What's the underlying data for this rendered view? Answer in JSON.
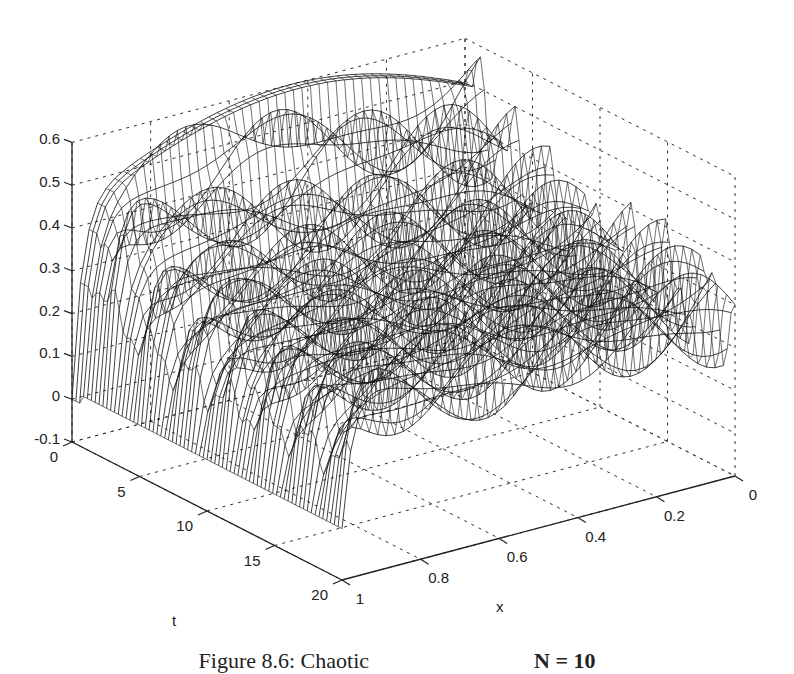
{
  "chart_data": {
    "type": "surface-mesh-3d",
    "title": "",
    "xlabel": "x",
    "ylabel": "t",
    "zlabel": "",
    "x_range": [
      0,
      1
    ],
    "t_range": [
      0,
      20
    ],
    "z_range": [
      -0.1,
      0.6
    ],
    "x_ticks": [
      "0",
      "0.2",
      "0.4",
      "0.6",
      "0.8",
      "1"
    ],
    "x_tick_values": [
      0,
      0.2,
      0.4,
      0.6,
      0.8,
      1
    ],
    "t_ticks": [
      "0",
      "5",
      "10",
      "15",
      "20"
    ],
    "t_tick_values": [
      0,
      5,
      10,
      15,
      20
    ],
    "z_ticks": [
      "0.6",
      "0.5",
      "0.4",
      "0.3",
      "0.2",
      "0.1",
      "0",
      "-0.1"
    ],
    "z_tick_values": [
      0.6,
      0.5,
      0.4,
      0.3,
      0.2,
      0.1,
      0,
      -0.1
    ],
    "grid": true,
    "sample_profile_t0": {
      "x": [
        1,
        0.95,
        0.9,
        0.8,
        0.6,
        0.4,
        0.2,
        0
      ],
      "z": [
        0,
        0.45,
        0.53,
        0.55,
        0.58,
        0.6,
        0.5,
        0.45
      ]
    },
    "ridge_peaks_z": [
      0.6,
      0.5,
      0.45,
      0.42,
      0.38,
      0.35,
      0.33,
      0.3,
      0.28,
      0.27,
      0.25
    ]
  },
  "caption": {
    "text": "Figure 8.6: Chaotic",
    "text_right": "N = 10"
  }
}
